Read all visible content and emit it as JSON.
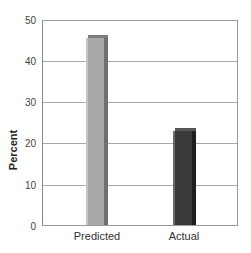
{
  "chart_data": {
    "type": "bar",
    "title": "",
    "xlabel": "",
    "ylabel": "Percent",
    "categories": [
      "Predicted",
      "Actual"
    ],
    "values": [
      46.5,
      24
    ],
    "ylim": [
      0,
      50
    ],
    "yticks": [
      0,
      10,
      20,
      30,
      40,
      50
    ],
    "grid": true,
    "legend": null,
    "bar_colors": [
      "#a9a9a9",
      "#3a3a3a"
    ]
  },
  "axis": {
    "ylabel": "Percent",
    "yticks": [
      "0",
      "10",
      "20",
      "30",
      "40",
      "50"
    ],
    "xticks": [
      "Predicted",
      "Actual"
    ]
  },
  "colors": {
    "predicted_face": "#a9a9a9",
    "predicted_side": "#6f6f6f",
    "predicted_top": "#7d7d7d",
    "actual_face": "#3a3a3a",
    "actual_side": "#1f1f1f",
    "actual_top": "#555555"
  }
}
